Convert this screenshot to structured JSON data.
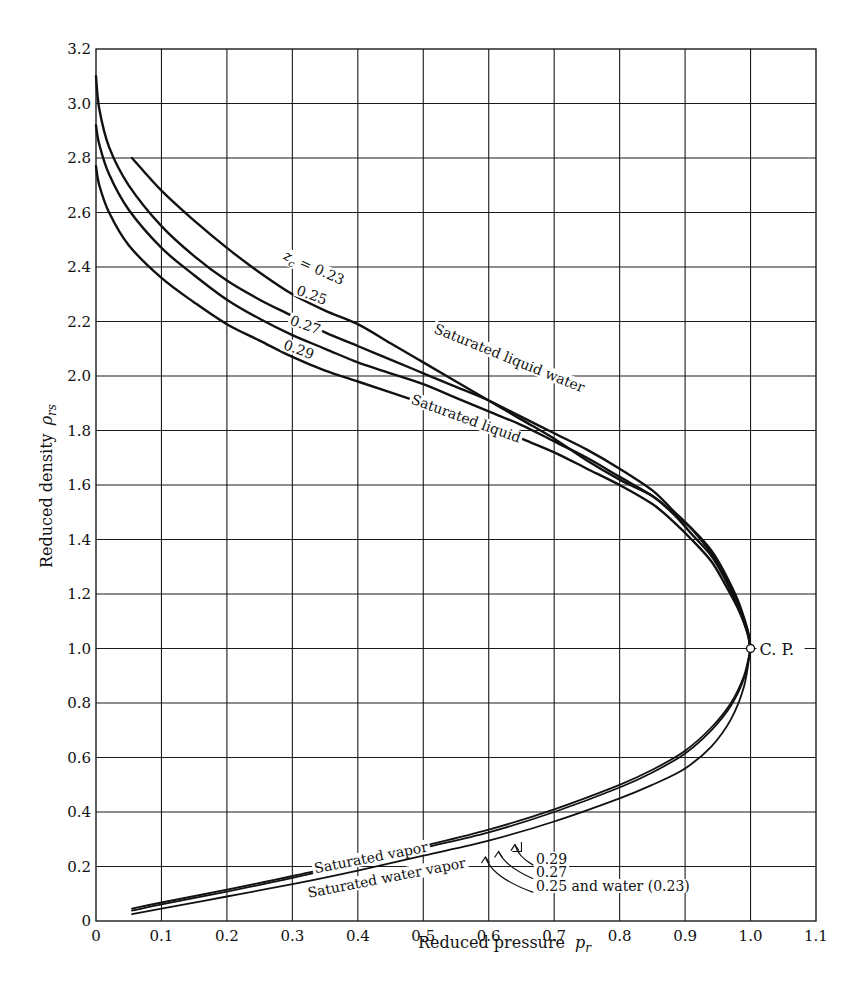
{
  "chart_data": {
    "type": "line",
    "title": "",
    "xlabel": "Reduced pressure",
    "xlabel_symbol": "p",
    "xlabel_subscript": "r",
    "ylabel": "Reduced density",
    "ylabel_symbol": "ρ",
    "ylabel_subscript": "rs",
    "xlim": [
      0,
      1.1
    ],
    "ylim": [
      0,
      3.2
    ],
    "grid": true,
    "x_ticks": [
      "0",
      "0.1",
      "0.2",
      "0.3",
      "0.4",
      "0.5",
      "0.6",
      "0.7",
      "0.8",
      "0.9",
      "1.0",
      "1.1"
    ],
    "y_ticks": [
      "0",
      "0.2",
      "0.4",
      "0.6",
      "0.8",
      "1.0",
      "1.2",
      "1.4",
      "1.6",
      "1.8",
      "2.0",
      "2.2",
      "2.4",
      "2.6",
      "2.8",
      "3.0",
      "3.2"
    ],
    "critical_point": {
      "x": 1.0,
      "y": 1.0,
      "label": "C. P."
    },
    "series": [
      {
        "name": "Saturated liquid water (zc = 0.23)",
        "branch": "liquid",
        "points": [
          [
            0.055,
            2.8
          ],
          [
            0.1,
            2.68
          ],
          [
            0.15,
            2.57
          ],
          [
            0.2,
            2.47
          ],
          [
            0.25,
            2.38
          ],
          [
            0.3,
            2.3
          ],
          [
            0.35,
            2.24
          ],
          [
            0.4,
            2.19
          ],
          [
            0.45,
            2.12
          ],
          [
            0.5,
            2.05
          ],
          [
            0.55,
            1.98
          ],
          [
            0.6,
            1.91
          ],
          [
            0.65,
            1.84
          ],
          [
            0.7,
            1.77
          ],
          [
            0.75,
            1.69
          ],
          [
            0.8,
            1.62
          ],
          [
            0.85,
            1.56
          ],
          [
            0.88,
            1.5
          ],
          [
            0.91,
            1.44
          ],
          [
            0.94,
            1.36
          ],
          [
            0.96,
            1.28
          ],
          [
            0.98,
            1.18
          ],
          [
            0.995,
            1.07
          ],
          [
            1.0,
            1.0
          ]
        ]
      },
      {
        "name": "zc = 0.25",
        "branch": "liquid",
        "points": [
          [
            0.0,
            3.1
          ],
          [
            0.005,
            2.98
          ],
          [
            0.02,
            2.84
          ],
          [
            0.05,
            2.7
          ],
          [
            0.1,
            2.55
          ],
          [
            0.15,
            2.44
          ],
          [
            0.2,
            2.35
          ],
          [
            0.25,
            2.28
          ],
          [
            0.3,
            2.22
          ],
          [
            0.35,
            2.16
          ],
          [
            0.4,
            2.11
          ],
          [
            0.45,
            2.06
          ],
          [
            0.5,
            2.01
          ],
          [
            0.55,
            1.96
          ],
          [
            0.6,
            1.91
          ],
          [
            0.65,
            1.85
          ],
          [
            0.7,
            1.79
          ],
          [
            0.75,
            1.73
          ],
          [
            0.8,
            1.66
          ],
          [
            0.85,
            1.58
          ],
          [
            0.88,
            1.51
          ],
          [
            0.91,
            1.44
          ],
          [
            0.94,
            1.35
          ],
          [
            0.96,
            1.27
          ],
          [
            0.98,
            1.17
          ],
          [
            0.995,
            1.07
          ],
          [
            1.0,
            1.0
          ]
        ]
      },
      {
        "name": "zc = 0.27",
        "branch": "liquid",
        "points": [
          [
            0.0,
            2.92
          ],
          [
            0.005,
            2.85
          ],
          [
            0.02,
            2.74
          ],
          [
            0.05,
            2.61
          ],
          [
            0.1,
            2.47
          ],
          [
            0.15,
            2.37
          ],
          [
            0.2,
            2.28
          ],
          [
            0.25,
            2.21
          ],
          [
            0.3,
            2.15
          ],
          [
            0.35,
            2.1
          ],
          [
            0.4,
            2.05
          ],
          [
            0.45,
            2.01
          ],
          [
            0.5,
            1.97
          ],
          [
            0.55,
            1.92
          ],
          [
            0.6,
            1.87
          ],
          [
            0.65,
            1.82
          ],
          [
            0.7,
            1.76
          ],
          [
            0.75,
            1.7
          ],
          [
            0.8,
            1.63
          ],
          [
            0.85,
            1.56
          ],
          [
            0.88,
            1.5
          ],
          [
            0.91,
            1.42
          ],
          [
            0.94,
            1.34
          ],
          [
            0.96,
            1.26
          ],
          [
            0.98,
            1.16
          ],
          [
            0.995,
            1.06
          ],
          [
            1.0,
            1.0
          ]
        ]
      },
      {
        "name": "zc = 0.29 (Saturated liquid)",
        "branch": "liquid",
        "points": [
          [
            0.0,
            2.77
          ],
          [
            0.005,
            2.7
          ],
          [
            0.02,
            2.6
          ],
          [
            0.05,
            2.48
          ],
          [
            0.1,
            2.36
          ],
          [
            0.15,
            2.27
          ],
          [
            0.2,
            2.19
          ],
          [
            0.25,
            2.13
          ],
          [
            0.3,
            2.07
          ],
          [
            0.35,
            2.02
          ],
          [
            0.4,
            1.98
          ],
          [
            0.45,
            1.94
          ],
          [
            0.5,
            1.9
          ],
          [
            0.55,
            1.86
          ],
          [
            0.6,
            1.82
          ],
          [
            0.65,
            1.77
          ],
          [
            0.7,
            1.72
          ],
          [
            0.75,
            1.66
          ],
          [
            0.8,
            1.6
          ],
          [
            0.85,
            1.53
          ],
          [
            0.88,
            1.47
          ],
          [
            0.91,
            1.4
          ],
          [
            0.94,
            1.32
          ],
          [
            0.96,
            1.24
          ],
          [
            0.98,
            1.15
          ],
          [
            0.995,
            1.06
          ],
          [
            1.0,
            1.0
          ]
        ]
      },
      {
        "name": "Saturated vapor zc = 0.29",
        "branch": "vapor",
        "points": [
          [
            0.055,
            0.045
          ],
          [
            0.1,
            0.068
          ],
          [
            0.2,
            0.115
          ],
          [
            0.3,
            0.165
          ],
          [
            0.4,
            0.22
          ],
          [
            0.5,
            0.275
          ],
          [
            0.6,
            0.335
          ],
          [
            0.7,
            0.41
          ],
          [
            0.8,
            0.5
          ],
          [
            0.85,
            0.555
          ],
          [
            0.9,
            0.625
          ],
          [
            0.94,
            0.71
          ],
          [
            0.97,
            0.8
          ],
          [
            0.99,
            0.9
          ],
          [
            1.0,
            1.0
          ]
        ]
      },
      {
        "name": "zc = 0.27",
        "branch": "vapor",
        "points": [
          [
            0.055,
            0.038
          ],
          [
            0.1,
            0.061
          ],
          [
            0.2,
            0.108
          ],
          [
            0.3,
            0.158
          ],
          [
            0.4,
            0.212
          ],
          [
            0.5,
            0.268
          ],
          [
            0.6,
            0.325
          ],
          [
            0.7,
            0.4
          ],
          [
            0.8,
            0.49
          ],
          [
            0.85,
            0.545
          ],
          [
            0.9,
            0.615
          ],
          [
            0.94,
            0.7
          ],
          [
            0.97,
            0.79
          ],
          [
            0.99,
            0.89
          ],
          [
            1.0,
            1.0
          ]
        ]
      },
      {
        "name": "Saturated water vapor; zc = 0.25 and water (0.23)",
        "branch": "vapor",
        "points": [
          [
            0.055,
            0.025
          ],
          [
            0.1,
            0.045
          ],
          [
            0.2,
            0.09
          ],
          [
            0.3,
            0.135
          ],
          [
            0.4,
            0.185
          ],
          [
            0.5,
            0.24
          ],
          [
            0.6,
            0.295
          ],
          [
            0.7,
            0.365
          ],
          [
            0.8,
            0.45
          ],
          [
            0.85,
            0.5
          ],
          [
            0.9,
            0.56
          ],
          [
            0.94,
            0.64
          ],
          [
            0.97,
            0.74
          ],
          [
            0.99,
            0.86
          ],
          [
            1.0,
            1.0
          ]
        ]
      }
    ],
    "annotations": [
      {
        "text": "z",
        "sub": "c",
        "rest": " = 0.23",
        "x": 0.285,
        "y": 2.43,
        "angle": 24
      },
      {
        "text": "0.25",
        "x": 0.305,
        "y": 2.3,
        "angle": 20
      },
      {
        "text": "0.27",
        "x": 0.295,
        "y": 2.19,
        "angle": 20
      },
      {
        "text": "0.29",
        "x": 0.285,
        "y": 2.1,
        "angle": 20
      },
      {
        "text": "Saturated liquid water",
        "x": 0.515,
        "y": 2.16,
        "angle": 22
      },
      {
        "text": "Saturated liquid",
        "x": 0.48,
        "y": 1.9,
        "angle": 20
      },
      {
        "text": "Saturated vapor",
        "x": 0.335,
        "y": 0.175,
        "angle": -11
      },
      {
        "text": "Saturated water vapor",
        "x": 0.325,
        "y": 0.085,
        "angle": -11
      },
      {
        "text": "0.29",
        "x": 0.672,
        "y": 0.21,
        "angle": 0
      },
      {
        "text": "0.27",
        "x": 0.672,
        "y": 0.16,
        "angle": 0
      },
      {
        "text": "0.25 and water (0.23)",
        "x": 0.672,
        "y": 0.11,
        "angle": 0
      }
    ]
  }
}
